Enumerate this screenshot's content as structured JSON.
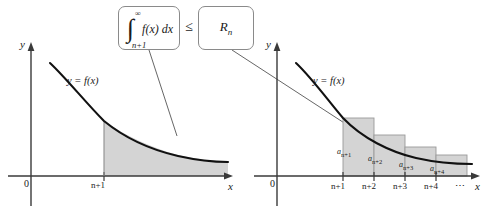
{
  "figure": {
    "title_callouts": {
      "integral": {
        "integral_sign": "∫",
        "upper_limit": "∞",
        "lower_limit": "n+1",
        "integrand": "f(x) dx"
      },
      "relation": "≤",
      "remainder": "R",
      "remainder_sub": "n"
    },
    "left_graph": {
      "y_axis_label": "y",
      "x_axis_label": "x",
      "origin_label": "0",
      "curve_label": "y = f(x)",
      "x_tick_label": "n+1",
      "shaded_region_color": "#d4d4d4",
      "curve_color": "#1a1a1a",
      "axis_color": "#3a3a3a"
    },
    "right_graph": {
      "y_axis_label": "y",
      "x_axis_label": "x",
      "origin_label": "0",
      "curve_label": "y = f(x)",
      "x_tick_labels": [
        "n+1",
        "n+2",
        "n+3",
        "n+4"
      ],
      "ellipsis": "⋯",
      "rectangle_labels": [
        "a",
        "a",
        "a",
        "a"
      ],
      "rectangle_subscripts": [
        "n+1",
        "n+2",
        "n+3",
        "n+4"
      ],
      "rectangle_fill": "#d4d4d4",
      "rectangle_stroke": "#9a9a9a"
    }
  }
}
